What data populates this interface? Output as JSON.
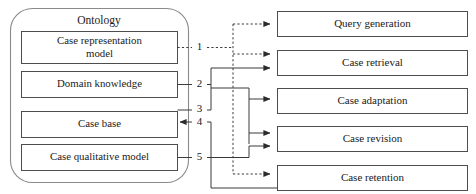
{
  "diagram": {
    "title": "Ontology",
    "ontology_items": [
      {
        "id": "case-representation-model",
        "line1": "Case representation",
        "line2": "model"
      },
      {
        "id": "domain-knowledge",
        "line1": "Domain knowledge",
        "line2": ""
      },
      {
        "id": "case-base",
        "line1": "Case base",
        "line2": ""
      },
      {
        "id": "case-qualitative-model",
        "line1": "Case qualitative model",
        "line2": ""
      }
    ],
    "stages": [
      {
        "id": "query-generation",
        "label": "Query generation"
      },
      {
        "id": "case-retrieval",
        "label": "Case retrieval"
      },
      {
        "id": "case-adaptation",
        "label": "Case adaptation"
      },
      {
        "id": "case-revision",
        "label": "Case revision"
      },
      {
        "id": "case-retention",
        "label": "Case retention"
      }
    ],
    "connector_labels": [
      {
        "id": "connector-1",
        "text": "1"
      },
      {
        "id": "connector-2",
        "text": "2"
      },
      {
        "id": "connector-3",
        "text": "3"
      },
      {
        "id": "connector-4",
        "text": "4"
      },
      {
        "id": "connector-5",
        "text": "5"
      }
    ],
    "colors": {
      "frame_stroke": "#8a8a8a",
      "box_stroke": "#4d4d4d",
      "wire_stroke": "#3a3a3a",
      "text": "#1a1a1a",
      "background": "#ffffff"
    }
  }
}
